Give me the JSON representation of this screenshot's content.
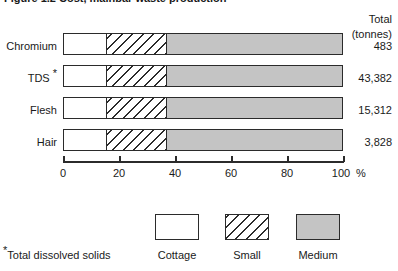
{
  "title": {
    "text": "Figure 1.2  Cost, mainbar waste production",
    "clipped": true
  },
  "chart_data": {
    "type": "bar",
    "orientation": "horizontal",
    "stacked": true,
    "normalized_percent": true,
    "title": "Figure 1.2  Cost, mainbar waste production",
    "xlabel": "%",
    "ylabel": "",
    "xlim": [
      0,
      100
    ],
    "grid": false,
    "legend_position": "bottom-center",
    "categories": [
      "Chromium",
      "TDS*",
      "Flesh",
      "Hair"
    ],
    "tick_labels": [
      "0",
      "20",
      "40",
      "60",
      "80",
      "100"
    ],
    "tick_values": [
      0,
      20,
      40,
      60,
      80,
      100
    ],
    "axis_unit": "%",
    "series": [
      {
        "name": "Cottage",
        "values": [
          15,
          15,
          15,
          15
        ]
      },
      {
        "name": "Small",
        "values": [
          22,
          22,
          22,
          22
        ]
      },
      {
        "name": "Medium",
        "values": [
          63,
          63,
          63,
          63
        ]
      }
    ],
    "totals_header_line1": "Total",
    "totals_header_line2": "(tonnes)",
    "totals": [
      "483",
      "43,382",
      "15,312",
      "3,828"
    ],
    "footnote": "Total dissolved solids",
    "footnote_marker": "*"
  },
  "legend": {
    "items": [
      {
        "label": "Cottage",
        "fill": "#ffffff"
      },
      {
        "label": "Small",
        "fill": "hatch"
      },
      {
        "label": "Medium",
        "fill": "#c4c4c4"
      }
    ]
  },
  "colors": {
    "ink": "#2b2b2b",
    "medium_fill": "#c4c4c4",
    "cottage_fill": "#ffffff",
    "background": "#ffffff"
  }
}
